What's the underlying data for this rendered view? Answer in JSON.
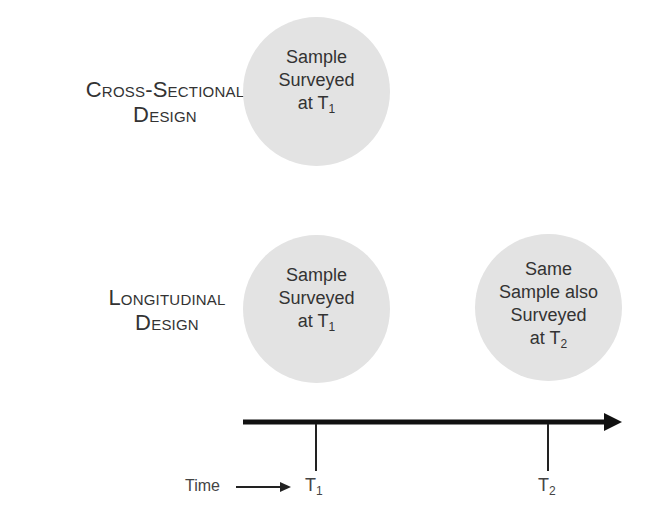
{
  "rows": [
    {
      "label_line1": "Cross-Sectional",
      "label_line2": "Design",
      "circles": [
        {
          "line1": "Sample",
          "line2": "Surveyed",
          "line3_prefix": "at T",
          "line3_sub": "1"
        }
      ]
    },
    {
      "label_line1": "Longitudinal",
      "label_line2": "Design",
      "circles": [
        {
          "line1": "Sample",
          "line2": "Surveyed",
          "line3_prefix": "at T",
          "line3_sub": "1"
        },
        {
          "line0": "Same",
          "line1": "Sample also",
          "line2": "Surveyed",
          "line3_prefix": "at T",
          "line3_sub": "2"
        }
      ]
    }
  ],
  "timeline": {
    "axis_label": "Time",
    "ticks": [
      {
        "prefix": "T",
        "sub": "1"
      },
      {
        "prefix": "T",
        "sub": "2"
      }
    ]
  },
  "colors": {
    "circle_fill": "#e3e3e3",
    "arrow": "#111111",
    "text": "#333333"
  }
}
